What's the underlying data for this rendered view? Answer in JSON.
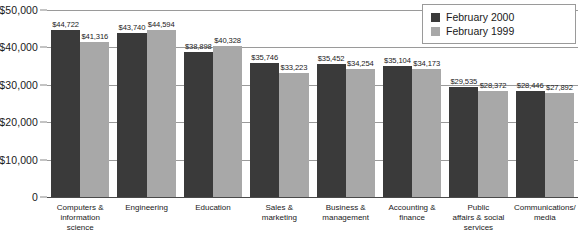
{
  "chart_data": {
    "type": "bar",
    "title": "",
    "xlabel": "",
    "ylabel": "",
    "ylim": [
      0,
      50000
    ],
    "grid": true,
    "legend_position": "top-right",
    "ytick_labels": [
      "$50,000",
      "$40,000",
      "$30,000",
      "$20,000",
      "$10,000",
      "0"
    ],
    "ytick_values": [
      50000,
      40000,
      30000,
      20000,
      10000,
      0
    ],
    "categories": [
      "Computers & information science",
      "Engineering",
      "Education",
      "Sales & marketing",
      "Business & management",
      "Accounting & finance",
      "Public affairs & social services",
      "Communications/ media"
    ],
    "category_lines": [
      [
        "Computers &",
        "information",
        "science"
      ],
      [
        "Engineering"
      ],
      [
        "Education"
      ],
      [
        "Sales &",
        "marketing"
      ],
      [
        "Business &",
        "management"
      ],
      [
        "Accounting &",
        "finance"
      ],
      [
        "Public",
        "affairs & social",
        "services"
      ],
      [
        "Communications/",
        "media"
      ]
    ],
    "series": [
      {
        "name": "February 2000",
        "color": "#3a3a3a",
        "values": [
          44722,
          43740,
          38898,
          35746,
          35452,
          35104,
          29535,
          28446
        ],
        "labels": [
          "$44,722",
          "$43,740",
          "$38,898",
          "$35,746",
          "$35,452",
          "$35,104",
          "$29,535",
          "$28,446"
        ]
      },
      {
        "name": "February 1999",
        "color": "#a8a8a8",
        "values": [
          41316,
          44594,
          40328,
          33223,
          34254,
          34173,
          28372,
          27892
        ],
        "labels": [
          "$41,316",
          "$44,594",
          "$40,328",
          "$33,223",
          "$34,254",
          "$34,173",
          "$28,372",
          "$27,892"
        ]
      }
    ]
  },
  "legend": {
    "items": [
      {
        "label": "February 2000",
        "color": "#3a3a3a"
      },
      {
        "label": "February 1999",
        "color": "#a8a8a8"
      }
    ]
  }
}
